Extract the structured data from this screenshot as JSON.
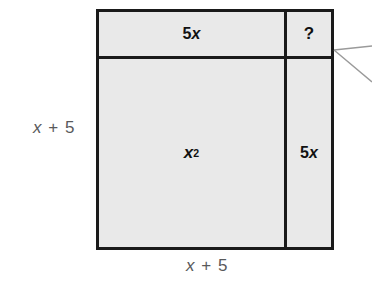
{
  "figure": {
    "type": "area-model-diagram",
    "fill_color": "#e9e9e9",
    "border_color": "#1a1a1a",
    "label_color": "#111111",
    "dimension_color": "#58595b",
    "callout_color": "#9a9a9a"
  },
  "cells": {
    "top_left": {
      "name": "5x-top-region",
      "coefficient": "5",
      "variable": "x"
    },
    "top_right": {
      "name": "unknown-region",
      "text": "?"
    },
    "main": {
      "name": "x-squared-region",
      "variable": "x",
      "exponent": "2"
    },
    "right": {
      "name": "5x-right-region",
      "coefficient": "5",
      "variable": "x"
    }
  },
  "dimensions": {
    "left": {
      "variable": "x",
      "operator": "+",
      "constant": "5"
    },
    "bottom": {
      "variable": "x",
      "operator": "+",
      "constant": "5"
    }
  },
  "callout": {
    "name": "callout-leader-lines",
    "anchor_x": 334,
    "anchor_y": 50,
    "line_count": 2
  }
}
